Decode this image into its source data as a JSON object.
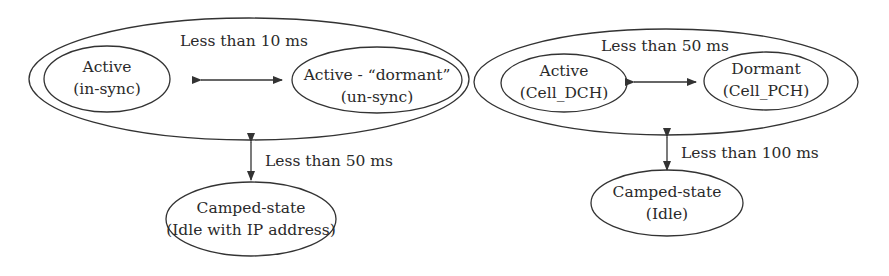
{
  "diagrams": [
    {
      "id": "left",
      "outer": {
        "label": "Less than 10 ms"
      },
      "state_a": {
        "line1": "Active",
        "line2": "(in-sync)"
      },
      "state_b": {
        "line1": "Active - “dormant”",
        "line2": "(un-sync)"
      },
      "vertical_label": "Less than 50 ms",
      "camped": {
        "line1": "Camped-state",
        "line2": "(Idle with IP address)"
      }
    },
    {
      "id": "right",
      "outer": {
        "label": "Less than 50 ms"
      },
      "state_a": {
        "line1": "Active",
        "line2": "(Cell_DCH)"
      },
      "state_b": {
        "line1": "Dormant",
        "line2": "(Cell_PCH)"
      },
      "vertical_label": "Less than 100 ms",
      "camped": {
        "line1": "Camped-state",
        "line2": "(Idle)"
      }
    }
  ],
  "colors": {
    "stroke": "#333333",
    "text": "#2a2a2a",
    "background": "#ffffff"
  }
}
